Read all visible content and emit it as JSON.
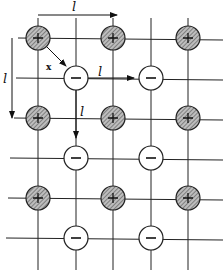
{
  "diagram": {
    "labels": {
      "top_spacing": "l",
      "left_spacing": "l",
      "diagonal": "x",
      "right_arrow": "l",
      "down_arrow": "l"
    },
    "positive_ions": [
      {
        "x": 38,
        "y": 38
      },
      {
        "x": 113,
        "y": 38
      },
      {
        "x": 188,
        "y": 38
      },
      {
        "x": 38,
        "y": 118
      },
      {
        "x": 113,
        "y": 118
      },
      {
        "x": 188,
        "y": 118
      },
      {
        "x": 38,
        "y": 198
      },
      {
        "x": 113,
        "y": 198
      },
      {
        "x": 188,
        "y": 198
      }
    ],
    "negative_ions": [
      {
        "x": 76,
        "y": 78
      },
      {
        "x": 151,
        "y": 78
      },
      {
        "x": 76,
        "y": 158
      },
      {
        "x": 151,
        "y": 158
      },
      {
        "x": 76,
        "y": 238
      },
      {
        "x": 151,
        "y": 238
      }
    ],
    "positive_symbol": "+",
    "negative_symbol": "−",
    "colors": {
      "line": "#222222",
      "positive_fill": "#9a9a9a",
      "negative_fill": "#ffffff"
    }
  }
}
